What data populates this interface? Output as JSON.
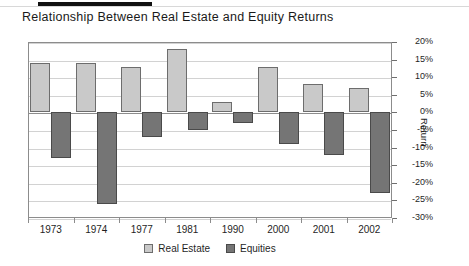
{
  "chart_data": {
    "type": "bar",
    "title": "Relationship Between Real Estate and Equity Returns",
    "xlabel": "",
    "ylabel": "Return",
    "categories": [
      "1973",
      "1974",
      "1977",
      "1981",
      "1990",
      "2000",
      "2001",
      "2002"
    ],
    "series": [
      {
        "name": "Real Estate",
        "color": "#c9c9c9",
        "values": [
          14,
          14,
          13,
          18,
          3,
          13,
          8,
          7
        ]
      },
      {
        "name": "Equities",
        "color": "#757575",
        "values": [
          -13,
          -26,
          -7,
          -5,
          -3,
          -9,
          -12,
          -23
        ]
      }
    ],
    "ylim": [
      -30,
      20
    ],
    "ytick_step": 5,
    "ytick_labels": [
      "20%",
      "15%",
      "10%",
      "5%",
      "0%",
      "-5%",
      "-10%",
      "-15%",
      "-20%",
      "-25%",
      "-30%"
    ],
    "ytick_values": [
      20,
      15,
      10,
      5,
      0,
      -5,
      -10,
      -15,
      -20,
      -25,
      -30
    ],
    "grid": true,
    "legend_position": "bottom",
    "value_unit": "%"
  },
  "legend": {
    "items": [
      {
        "label": "Real Estate"
      },
      {
        "label": "Equities"
      }
    ]
  }
}
